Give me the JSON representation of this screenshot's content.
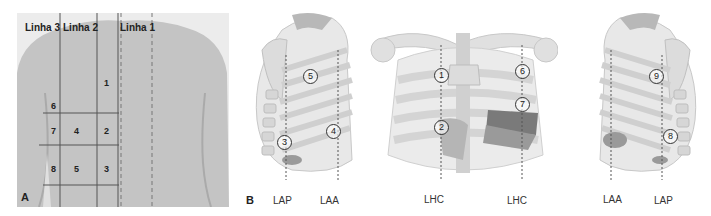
{
  "figure": {
    "panel_a": {
      "letter": "A",
      "line_labels": [
        "Linha 3",
        "Linha 2",
        "Linha 1"
      ],
      "zones": [
        "1",
        "2",
        "3",
        "4",
        "5",
        "6",
        "7",
        "8"
      ],
      "colors": {
        "skin": "#c4c4c4",
        "lines": "#555555"
      }
    },
    "panel_b": {
      "letter": "B",
      "left_view": {
        "points": [
          "5",
          "4",
          "3"
        ],
        "axis_labels": [
          "LAP",
          "LAA"
        ]
      },
      "front_view": {
        "points": [
          "1",
          "2",
          "6",
          "7"
        ],
        "axis_labels": [
          "LHC",
          "LHC"
        ]
      },
      "right_view": {
        "points": [
          "9",
          "8"
        ],
        "axis_labels": [
          "LAA",
          "LAP"
        ]
      },
      "colors": {
        "bone": "#e3e3e3",
        "rib": "#d2d2d2",
        "organ": "#9a9a9a",
        "dark": "#7a7a7a"
      }
    }
  }
}
